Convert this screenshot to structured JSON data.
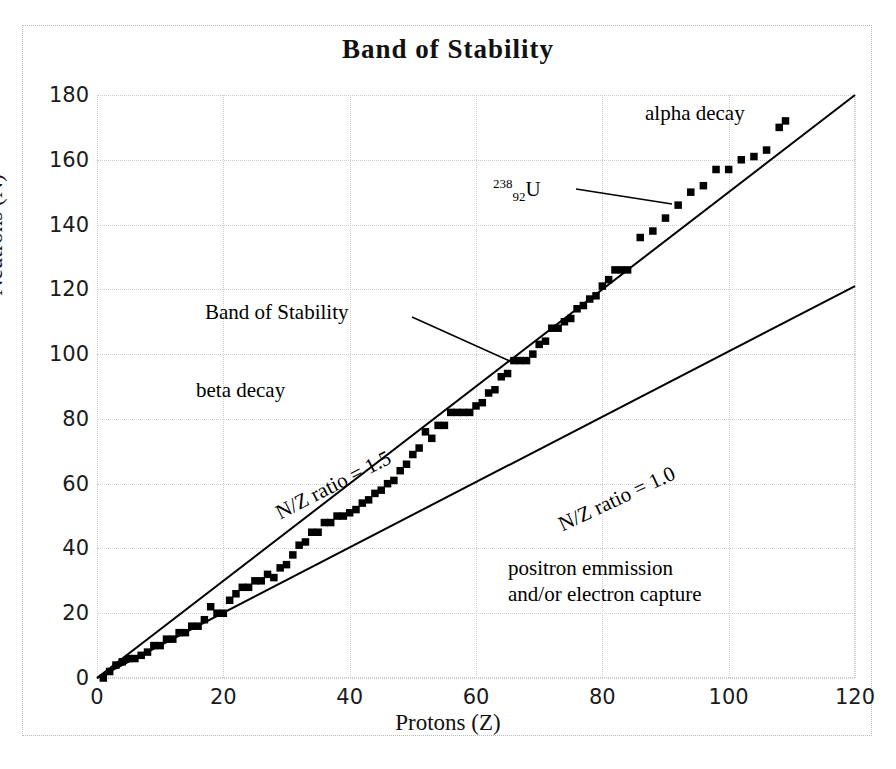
{
  "chart_data": {
    "type": "scatter",
    "title": "Band of Stability",
    "xlabel": "Protons (Z)",
    "ylabel": "Neutrons (N)",
    "xlim": [
      0,
      120
    ],
    "ylim": [
      0,
      180
    ],
    "xticks": [
      0,
      20,
      40,
      60,
      80,
      100,
      120
    ],
    "yticks": [
      0,
      20,
      40,
      60,
      80,
      100,
      120,
      140,
      160,
      180
    ],
    "grid": true,
    "legend": "none",
    "series": [
      {
        "name": "stable nuclides",
        "marker": "filled-square",
        "color": "#000000",
        "x": [
          1,
          2,
          3,
          4,
          5,
          6,
          7,
          8,
          9,
          10,
          11,
          12,
          13,
          14,
          15,
          16,
          17,
          18,
          19,
          20,
          21,
          22,
          23,
          24,
          25,
          26,
          27,
          28,
          29,
          30,
          31,
          32,
          33,
          34,
          35,
          36,
          37,
          38,
          39,
          40,
          41,
          42,
          43,
          44,
          45,
          46,
          47,
          48,
          49,
          50,
          51,
          52,
          53,
          54,
          55,
          56,
          57,
          58,
          59,
          60,
          61,
          62,
          63,
          64,
          65,
          66,
          67,
          68,
          69,
          70,
          71,
          72,
          73,
          74,
          75,
          76,
          77,
          78,
          79,
          80,
          81,
          82,
          83,
          84,
          86,
          88,
          90,
          92,
          94,
          96,
          98,
          100,
          102,
          104,
          106,
          108,
          109
        ],
        "y": [
          0,
          2,
          4,
          5,
          6,
          6,
          7,
          8,
          10,
          10,
          12,
          12,
          14,
          14,
          16,
          16,
          18,
          22,
          20,
          20,
          24,
          26,
          28,
          28,
          30,
          30,
          32,
          31,
          34,
          35,
          38,
          41,
          42,
          45,
          45,
          48,
          48,
          50,
          50,
          51,
          52,
          54,
          55,
          57,
          58,
          60,
          61,
          64,
          66,
          69,
          71,
          76,
          74,
          78,
          78,
          82,
          82,
          82,
          82,
          84,
          85,
          88,
          89,
          93,
          94,
          98,
          98,
          98,
          100,
          103,
          104,
          108,
          108,
          110,
          111,
          114,
          115,
          117,
          118,
          121,
          123,
          126,
          126,
          126,
          136,
          138,
          142,
          146,
          150,
          152,
          157,
          157,
          160,
          161,
          163,
          170,
          172
        ]
      },
      {
        "name": "N/Z ratio = 1.5",
        "type": "line",
        "points": [
          [
            0,
            0
          ],
          [
            120,
            180
          ]
        ]
      },
      {
        "name": "N/Z ratio = 1.0",
        "type": "line",
        "points": [
          [
            0,
            0
          ],
          [
            120,
            121
          ]
        ]
      }
    ],
    "annotations": [
      {
        "id": "band-of-stability",
        "text": "Band of Stability",
        "x": 25,
        "y": 112,
        "leader_to": [
          65,
          103
        ]
      },
      {
        "id": "beta-decay",
        "text": "beta decay",
        "x": 16,
        "y": 90
      },
      {
        "id": "alpha-decay",
        "text": "alpha decay",
        "x": 89,
        "y": 173
      },
      {
        "id": "u238",
        "text": "238 92 U",
        "x": 77,
        "y": 150,
        "leader_to": [
          92,
          146
        ]
      },
      {
        "id": "nz-ratio-15",
        "text": "N/Z ratio = 1.5",
        "x": 38,
        "y": 70
      },
      {
        "id": "nz-ratio-10",
        "text": "N/Z ratio = 1.0",
        "x": 83,
        "y": 66
      },
      {
        "id": "positron-emission",
        "text": "positron emmission",
        "x": 67,
        "y": 36
      },
      {
        "id": "electron-capture",
        "text": "and/or electron capture",
        "x": 67,
        "y": 28
      }
    ]
  },
  "labels": {
    "title": "Band of Stability",
    "xlabel": "Protons (Z)",
    "ylabel": "Neutrons (N)",
    "yticks": [
      "180",
      "160",
      "140",
      "120",
      "100",
      "80",
      "60",
      "40",
      "20",
      "0"
    ],
    "xticks": [
      "0",
      "20",
      "40",
      "60",
      "80",
      "100",
      "120"
    ],
    "band_of_stability": "Band of Stability",
    "beta_decay": "beta decay",
    "alpha_decay": "alpha decay",
    "nz_ratio_15": "N/Z ratio = 1.5",
    "nz_ratio_10": "N/Z ratio = 1.0",
    "positron_line1": "positron emmission",
    "positron_line2": "and/or electron capture",
    "u238_mass": "238",
    "u238_atomic": "92",
    "u238_symbol": "U"
  },
  "colors": {
    "marker": "#000000",
    "line": "#000000",
    "grid": "#cfcfcf",
    "text": "#111111",
    "background": "#ffffff"
  }
}
